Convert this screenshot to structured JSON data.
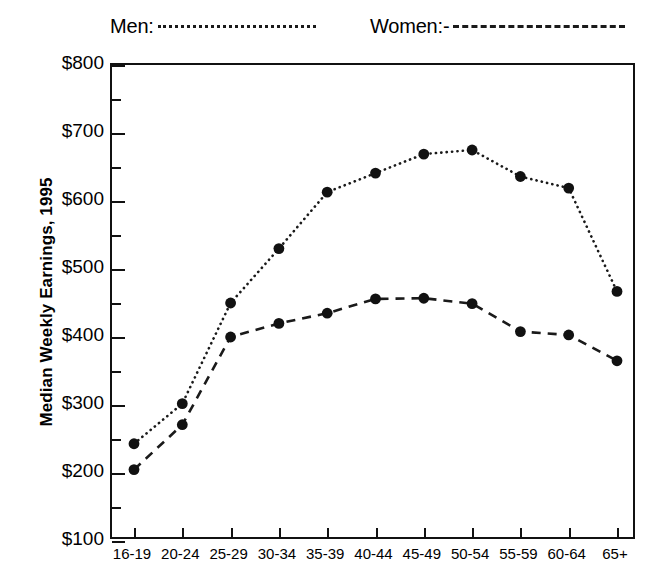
{
  "chart_data": {
    "type": "line",
    "title": "",
    "xlabel": "",
    "ylabel": "Median Weekly Earnings, 1995",
    "categories": [
      "16-19",
      "20-24",
      "25-29",
      "30-34",
      "35-39",
      "40-44",
      "45-49",
      "50-54",
      "55-59",
      "60-64",
      "65+"
    ],
    "series": [
      {
        "name": "Men:",
        "style": "dotted",
        "values": [
          243,
          302,
          450,
          530,
          613,
          641,
          669,
          675,
          636,
          619,
          467
        ]
      },
      {
        "name": "Women:-",
        "style": "dashed",
        "values": [
          205,
          271,
          400,
          420,
          435,
          456,
          457,
          449,
          408,
          403,
          365
        ]
      }
    ],
    "ylim": [
      100,
      800
    ],
    "y_major_ticks": [
      100,
      200,
      300,
      400,
      500,
      600,
      700,
      800
    ],
    "y_minor_ticks": [
      150,
      250,
      350,
      450,
      550,
      650,
      750
    ],
    "y_tick_labels": [
      "$100",
      "$200",
      "$300",
      "$400",
      "$500",
      "$600",
      "$700",
      "$800"
    ],
    "grid": false,
    "legend_position": "top",
    "marker": "filled-circle",
    "marker_color": "#111111",
    "line_color": "#1a1a1a",
    "axis_color": "#111111"
  },
  "legend": {
    "men_label": "Men:",
    "women_label": "Women:-"
  },
  "axes": {
    "y_title": "Median Weekly Earnings, 1995"
  }
}
